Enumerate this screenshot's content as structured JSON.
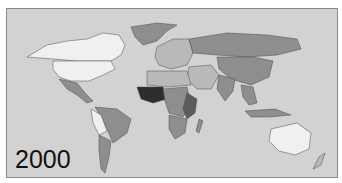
{
  "map": {
    "year_label": "2000",
    "projection": "world",
    "background_color": "#d2d2d2",
    "shade_scale": [
      "#f0f0f0",
      "#b9b9b9",
      "#8e8e8e",
      "#5c5c5c",
      "#2e2e2e"
    ],
    "regions": [
      {
        "name": "north-america-canada",
        "shade": 0
      },
      {
        "name": "north-america-usa",
        "shade": 0
      },
      {
        "name": "greenland",
        "shade": 2
      },
      {
        "name": "mexico-central-america",
        "shade": 2
      },
      {
        "name": "south-america-brazil",
        "shade": 2
      },
      {
        "name": "south-america-peru-bolivia",
        "shade": 0
      },
      {
        "name": "south-america-argentina-chile",
        "shade": 2
      },
      {
        "name": "europe",
        "shade": 1
      },
      {
        "name": "russia",
        "shade": 2
      },
      {
        "name": "china",
        "shade": 2
      },
      {
        "name": "middle-east",
        "shade": 1
      },
      {
        "name": "india",
        "shade": 2
      },
      {
        "name": "north-africa",
        "shade": 1
      },
      {
        "name": "west-africa",
        "shade": 4
      },
      {
        "name": "central-africa",
        "shade": 2
      },
      {
        "name": "east-africa",
        "shade": 3
      },
      {
        "name": "southern-africa",
        "shade": 2
      },
      {
        "name": "southeast-asia",
        "shade": 2
      },
      {
        "name": "australia",
        "shade": 0
      },
      {
        "name": "new-zealand",
        "shade": 1
      }
    ]
  }
}
